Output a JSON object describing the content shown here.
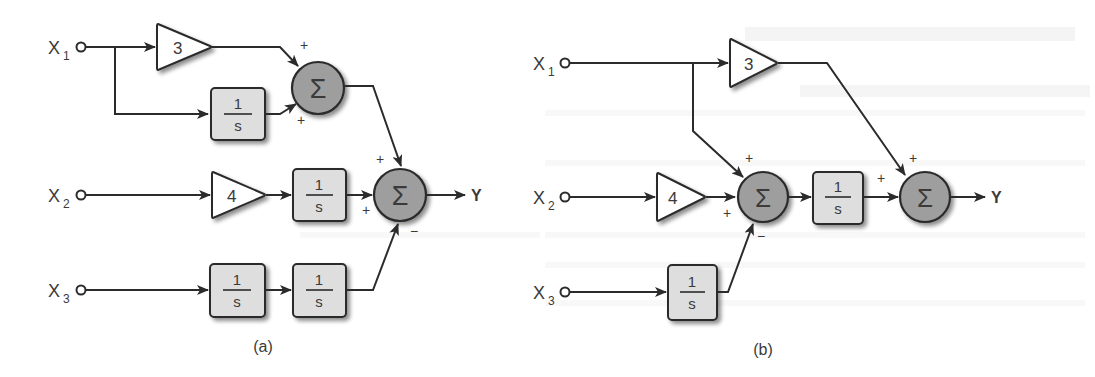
{
  "figure": {
    "colors": {
      "line": "#2b2b2b",
      "summer_fill": "#9e9e9e",
      "block_fill": "#dedede",
      "gain_fill": "#ffffff",
      "label": "#3a3a3a",
      "background": "#ffffff"
    },
    "integrator": {
      "numerator": "1",
      "denominator": "s"
    },
    "sum_symbol": "Σ",
    "plus": "+",
    "minus": "−",
    "diagram_a": {
      "caption": "(a)",
      "inputs": [
        {
          "name": "X",
          "sub": "1"
        },
        {
          "name": "X",
          "sub": "2"
        },
        {
          "name": "X",
          "sub": "3"
        }
      ],
      "gains": [
        {
          "id": "gain-3",
          "value": "3"
        },
        {
          "id": "gain-4",
          "value": "4"
        }
      ],
      "output": "Y",
      "summers": [
        {
          "id": "sum1",
          "signs": [
            "+",
            "+"
          ]
        },
        {
          "id": "sum2",
          "signs": [
            "+",
            "+",
            "−"
          ]
        }
      ]
    },
    "diagram_b": {
      "caption": "(b)",
      "inputs": [
        {
          "name": "X",
          "sub": "1"
        },
        {
          "name": "X",
          "sub": "2"
        },
        {
          "name": "X",
          "sub": "3"
        }
      ],
      "gains": [
        {
          "id": "gain-3",
          "value": "3"
        },
        {
          "id": "gain-4",
          "value": "4"
        }
      ],
      "output": "Y",
      "summers": [
        {
          "id": "sum1",
          "signs": [
            "+",
            "+",
            "−"
          ]
        },
        {
          "id": "sum2",
          "signs": [
            "+",
            "+"
          ]
        }
      ]
    }
  }
}
